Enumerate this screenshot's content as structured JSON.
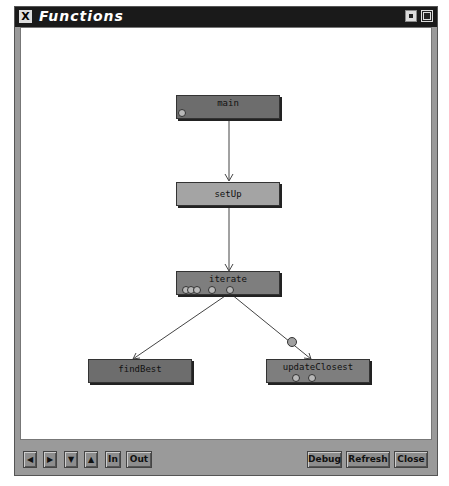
{
  "window": {
    "title": "Functions"
  },
  "graph": {
    "nodes": [
      {
        "id": "main",
        "label": "main",
        "shade": "dark"
      },
      {
        "id": "setUp",
        "label": "setUp",
        "shade": "light"
      },
      {
        "id": "iterate",
        "label": "iterate",
        "shade": "mid"
      },
      {
        "id": "findBest",
        "label": "findBest",
        "shade": "dark"
      },
      {
        "id": "updateClosest",
        "label": "updateClosest",
        "shade": "mid"
      }
    ],
    "edges": [
      {
        "from": "main",
        "to": "setUp"
      },
      {
        "from": "setUp",
        "to": "iterate"
      },
      {
        "from": "iterate",
        "to": "findBest"
      },
      {
        "from": "iterate",
        "to": "updateClosest"
      }
    ]
  },
  "toolbar": {
    "left_label": "◀",
    "right_label": "▶",
    "down_label": "▼",
    "up_label": "▲",
    "in_label": "In",
    "out_label": "Out",
    "debug_label": "Debug",
    "refresh_label": "Refresh",
    "close_label": "Close"
  }
}
